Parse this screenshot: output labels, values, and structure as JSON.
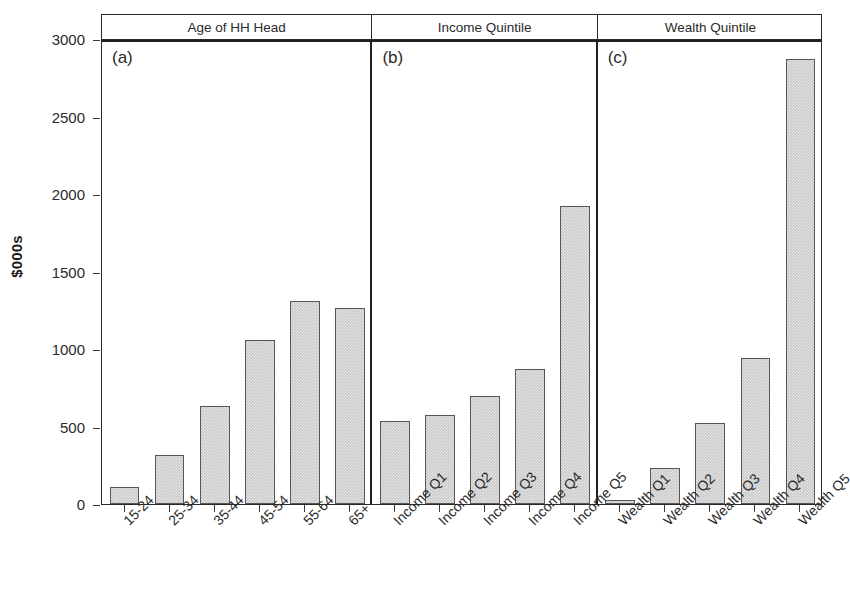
{
  "chart_data": {
    "type": "bar",
    "title": "",
    "xlabel": "",
    "ylabel": "$000s",
    "ylim": [
      0,
      3000
    ],
    "yticks": [
      0,
      500,
      1000,
      1500,
      2000,
      2500,
      3000
    ],
    "ytick_labels": [
      "0",
      "500",
      "1000",
      "1500",
      "2000",
      "2500",
      "3000"
    ],
    "grid": false,
    "legend": "none",
    "panel_layout": "1x3 horizontal strip panels",
    "panels": [
      {
        "tag": "(a)",
        "strip_label": "Age of HH Head",
        "categories": [
          "15-24",
          "25-34",
          "35-44",
          "45-54",
          "55-64",
          "65+"
        ],
        "values": [
          110,
          315,
          635,
          1055,
          1310,
          1265
        ]
      },
      {
        "tag": "(b)",
        "strip_label": "Income Quintile",
        "categories": [
          "Income Q1",
          "Income Q2",
          "Income Q3",
          "Income Q4",
          "Income Q5"
        ],
        "values": [
          535,
          575,
          695,
          870,
          1920
        ]
      },
      {
        "tag": "(c)",
        "strip_label": "Wealth Quintile",
        "categories": [
          "Wealth Q1",
          "Wealth Q2",
          "Wealth Q3",
          "Wealth Q4",
          "Wealth Q5"
        ],
        "values": [
          25,
          230,
          520,
          945,
          2870
        ]
      }
    ],
    "colors": {
      "bar_fill": "#c9c9c9",
      "bar_border": "#555555",
      "axis": "#2a2a2a",
      "text": "#2b2b2b",
      "background": "#ffffff"
    }
  },
  "caption": ""
}
